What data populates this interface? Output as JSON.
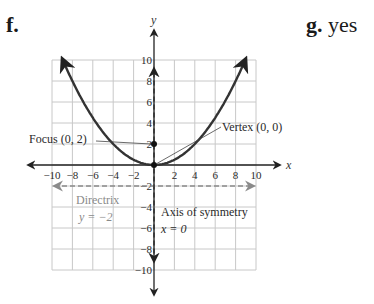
{
  "labels": {
    "part_f": "f.",
    "part_g_letter": "g.",
    "part_g_answer": "yes"
  },
  "chart_data": {
    "type": "line",
    "title": "",
    "xlabel": "x",
    "ylabel": "y",
    "xlim": [
      -10,
      10
    ],
    "ylim": [
      -10,
      10
    ],
    "grid": true,
    "grid_step": 2,
    "x_ticks": [
      "-10",
      "-8",
      "-6",
      "-4",
      "-2",
      "2",
      "4",
      "6",
      "8",
      "10"
    ],
    "y_ticks": [
      "10",
      "8",
      "6",
      "4",
      "2",
      "-2",
      "-4",
      "-6",
      "-8",
      "-10"
    ],
    "series": [
      {
        "name": "Parabola x^2 = 8y",
        "equation": "y = x^2/8",
        "x_range": [
          -9,
          9
        ],
        "color": "#333333",
        "arrows": true
      },
      {
        "name": "Directrix",
        "equation": "y = -2",
        "style": "dashed",
        "color": "#8a8a8a",
        "arrows": true
      },
      {
        "name": "Axis of symmetry",
        "equation": "x = 0",
        "style": "dashed",
        "color": "#333333",
        "arrows": true
      }
    ],
    "points": [
      {
        "name": "Focus",
        "x": 0,
        "y": 2
      },
      {
        "name": "Vertex",
        "x": 0,
        "y": 0
      }
    ],
    "annotations": {
      "focus": "Focus (0, 2)",
      "vertex": "Vertex (0, 0)",
      "directrix_title": "Directrix",
      "directrix_eq": "y = −2",
      "axis_title": "Axis of symmetry",
      "axis_eq": "x = 0"
    }
  }
}
